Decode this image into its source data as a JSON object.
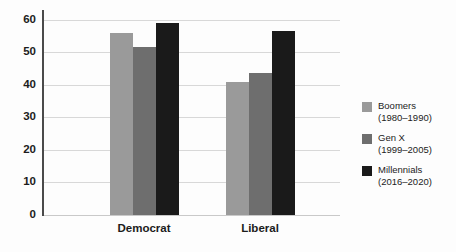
{
  "chart_data": {
    "type": "bar",
    "title": "",
    "xlabel": "",
    "ylabel": "",
    "categories": [
      "Democrat",
      "Liberal"
    ],
    "series": [
      {
        "name": "Boomers",
        "years": "(1980–1990)",
        "color": "#9a9a9a",
        "values": [
          56,
          41
        ]
      },
      {
        "name": "Gen X",
        "years": "(1999–2005)",
        "color": "#6e6e6e",
        "values": [
          51.5,
          43.5
        ]
      },
      {
        "name": "Millennials",
        "years": "(2016–2020)",
        "color": "#1a1a1a",
        "values": [
          59,
          56.5
        ]
      }
    ],
    "ylim": [
      0,
      63
    ],
    "yticks": [
      0,
      10,
      20,
      30,
      40,
      50,
      60
    ],
    "ytick_labels": [
      "0",
      "10",
      "20",
      "30",
      "40",
      "50",
      "60"
    ],
    "grid": true,
    "legend_position": "right",
    "legend": [
      {
        "label": "Boomers",
        "years": "(1980–1990)",
        "color": "#9a9a9a"
      },
      {
        "label": "Gen X",
        "years": "(1999–2005)",
        "color": "#6e6e6e"
      },
      {
        "label": "Millennials",
        "years": "(2016–2020)",
        "color": "#1a1a1a"
      }
    ]
  },
  "axis": {
    "y_tick_0": "0",
    "y_tick_1": "10",
    "y_tick_2": "20",
    "y_tick_3": "30",
    "y_tick_4": "40",
    "y_tick_5": "50",
    "y_tick_6": "60",
    "x_tick_0": "Democrat",
    "x_tick_1": "Liberal"
  },
  "legend": {
    "item_0_label": "Boomers",
    "item_0_years": "(1980–1990)",
    "item_1_label": "Gen X",
    "item_1_years": "(1999–2005)",
    "item_2_label": "Millennials",
    "item_2_years": "(2016–2020)"
  }
}
